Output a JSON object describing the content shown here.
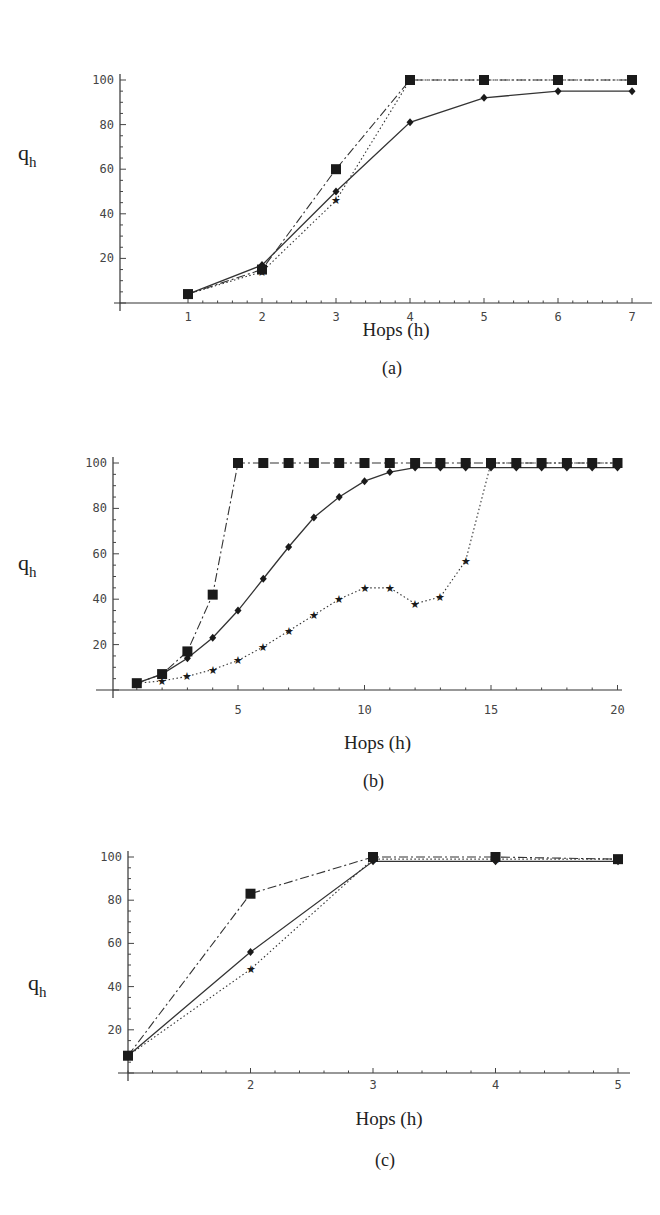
{
  "figure": {
    "panels": [
      {
        "caption": "(a)",
        "xlabel": "Hops (h)",
        "ylabel": "q",
        "ylabel_sub": "h"
      },
      {
        "caption": "(b)",
        "xlabel": "Hops (h)",
        "ylabel": "q",
        "ylabel_sub": "h"
      },
      {
        "caption": "(c)",
        "xlabel": "Hops (h)",
        "ylabel": "q",
        "ylabel_sub": "h"
      }
    ]
  },
  "chart_data": [
    {
      "type": "line",
      "title": "(a)",
      "xlabel": "Hops (h)",
      "ylabel": "q_h",
      "x": [
        1,
        2,
        3,
        4,
        5,
        6,
        7
      ],
      "xticks": [
        1,
        2,
        3,
        4,
        5,
        6,
        7
      ],
      "yticks": [
        20,
        40,
        60,
        80,
        100
      ],
      "ylim": [
        0,
        100
      ],
      "grid": false,
      "series": [
        {
          "name": "solid-diamond",
          "style": "solid",
          "marker": "diamond",
          "values": [
            4,
            17,
            50,
            81,
            92,
            95,
            95
          ]
        },
        {
          "name": "dashdot-square",
          "style": "dashdot",
          "marker": "square",
          "values": [
            4,
            15,
            60,
            100,
            100,
            100,
            100
          ]
        },
        {
          "name": "dotted-star",
          "style": "dotted",
          "marker": "star",
          "values": [
            4,
            14,
            46,
            100,
            100,
            100,
            100
          ]
        }
      ]
    },
    {
      "type": "line",
      "title": "(b)",
      "xlabel": "Hops (h)",
      "ylabel": "q_h",
      "x": [
        1,
        2,
        3,
        4,
        5,
        6,
        7,
        8,
        9,
        10,
        11,
        12,
        13,
        14,
        15,
        16,
        17,
        18,
        19,
        20
      ],
      "xticks": [
        5,
        10,
        15,
        20
      ],
      "yticks": [
        20,
        40,
        60,
        80,
        100
      ],
      "ylim": [
        0,
        100
      ],
      "grid": false,
      "series": [
        {
          "name": "solid-diamond",
          "style": "solid",
          "marker": "diamond",
          "values": [
            3,
            7,
            14,
            23,
            35,
            49,
            63,
            76,
            85,
            92,
            96,
            98,
            98,
            98,
            98,
            98,
            98,
            98,
            98,
            98
          ]
        },
        {
          "name": "dashdot-square",
          "style": "dashdot",
          "marker": "square",
          "values": [
            3,
            7,
            17,
            42,
            100,
            100,
            100,
            100,
            100,
            100,
            100,
            100,
            100,
            100,
            100,
            100,
            100,
            100,
            100,
            100
          ]
        },
        {
          "name": "dotted-star",
          "style": "dotted",
          "marker": "star",
          "values": [
            3,
            4,
            6,
            9,
            13,
            19,
            26,
            33,
            40,
            45,
            45,
            38,
            41,
            57,
            100,
            100,
            100,
            100,
            100,
            100
          ]
        }
      ]
    },
    {
      "type": "line",
      "title": "(c)",
      "xlabel": "Hops (h)",
      "ylabel": "q_h",
      "x": [
        1,
        2,
        3,
        4,
        5
      ],
      "xticks": [
        2,
        3,
        4,
        5
      ],
      "yticks": [
        20,
        40,
        60,
        80,
        100
      ],
      "ylim": [
        0,
        100
      ],
      "grid": false,
      "series": [
        {
          "name": "solid-diamond",
          "style": "solid",
          "marker": "diamond",
          "values": [
            8,
            56,
            98,
            98,
            98
          ]
        },
        {
          "name": "dashdot-square",
          "style": "dashdot",
          "marker": "square",
          "values": [
            8,
            83,
            100,
            100,
            99
          ]
        },
        {
          "name": "dotted-star",
          "style": "dotted",
          "marker": "star",
          "values": [
            8,
            48,
            99,
            99,
            99
          ]
        }
      ]
    }
  ]
}
